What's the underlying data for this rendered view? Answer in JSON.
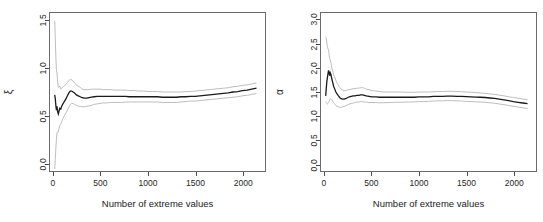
{
  "figure": {
    "background": "#ffffff",
    "line_color": "#1a1a1a",
    "band_color": "#b5b5b5",
    "axis_color": "#4d4d4d",
    "panel_count": 2
  },
  "chart_data": [
    {
      "type": "line",
      "panel": "left",
      "title": "",
      "xlabel": "Number of extreme values",
      "ylabel": "ξ",
      "ylabel_name": "xi",
      "xlim": [
        -40,
        2240
      ],
      "ylim": [
        -0.08,
        1.58
      ],
      "xticks": [
        0,
        500,
        1000,
        1500,
        2000
      ],
      "xtick_labels": [
        "0",
        "500",
        "1000",
        "1500",
        "2000"
      ],
      "yticks": [
        0.0,
        0.5,
        1.0,
        1.5
      ],
      "ytick_labels": [
        "0.0",
        "0.5",
        "1.0",
        "1.5"
      ],
      "grid": false,
      "legend": null,
      "x": [
        10,
        16,
        22,
        28,
        34,
        40,
        48,
        56,
        64,
        74,
        84,
        94,
        106,
        118,
        130,
        145,
        160,
        175,
        190,
        205,
        220,
        240,
        260,
        280,
        300,
        325,
        350,
        375,
        400,
        430,
        460,
        490,
        520,
        560,
        600,
        640,
        680,
        720,
        760,
        800,
        850,
        900,
        950,
        1000,
        1050,
        1100,
        1150,
        1200,
        1250,
        1300,
        1350,
        1400,
        1450,
        1500,
        1550,
        1600,
        1650,
        1700,
        1750,
        1800,
        1850,
        1900,
        1950,
        2000,
        2050,
        2100,
        2150
      ],
      "series": [
        {
          "name": "estimate",
          "role": "center",
          "color": "#1a1a1a",
          "values": [
            0.72,
            0.68,
            0.61,
            0.56,
            0.6,
            0.55,
            0.52,
            0.55,
            0.58,
            0.57,
            0.6,
            0.62,
            0.64,
            0.66,
            0.68,
            0.71,
            0.74,
            0.76,
            0.76,
            0.75,
            0.74,
            0.72,
            0.71,
            0.7,
            0.69,
            0.685,
            0.685,
            0.69,
            0.695,
            0.7,
            0.705,
            0.705,
            0.705,
            0.705,
            0.705,
            0.705,
            0.705,
            0.705,
            0.705,
            0.7,
            0.7,
            0.7,
            0.7,
            0.7,
            0.7,
            0.7,
            0.695,
            0.695,
            0.695,
            0.695,
            0.7,
            0.7,
            0.705,
            0.705,
            0.71,
            0.715,
            0.72,
            0.725,
            0.73,
            0.735,
            0.74,
            0.75,
            0.755,
            0.765,
            0.77,
            0.78,
            0.79
          ]
        },
        {
          "name": "upper confidence bound",
          "role": "upper",
          "color": "#b5b5b5",
          "values": [
            1.5,
            1.32,
            1.12,
            0.98,
            0.95,
            0.86,
            0.8,
            0.8,
            0.81,
            0.78,
            0.79,
            0.8,
            0.81,
            0.82,
            0.83,
            0.85,
            0.87,
            0.88,
            0.88,
            0.86,
            0.85,
            0.82,
            0.81,
            0.8,
            0.78,
            0.775,
            0.775,
            0.775,
            0.78,
            0.78,
            0.78,
            0.78,
            0.775,
            0.775,
            0.775,
            0.77,
            0.77,
            0.77,
            0.77,
            0.765,
            0.765,
            0.76,
            0.76,
            0.755,
            0.755,
            0.755,
            0.75,
            0.75,
            0.75,
            0.75,
            0.75,
            0.755,
            0.755,
            0.76,
            0.765,
            0.77,
            0.775,
            0.78,
            0.785,
            0.79,
            0.795,
            0.805,
            0.81,
            0.82,
            0.825,
            0.835,
            0.845
          ]
        },
        {
          "name": "lower confidence bound",
          "role": "lower",
          "color": "#b5b5b5",
          "values": [
            -0.06,
            0.04,
            0.16,
            0.25,
            0.32,
            0.33,
            0.33,
            0.37,
            0.4,
            0.41,
            0.44,
            0.46,
            0.49,
            0.51,
            0.53,
            0.56,
            0.59,
            0.62,
            0.63,
            0.63,
            0.62,
            0.61,
            0.6,
            0.6,
            0.595,
            0.595,
            0.6,
            0.605,
            0.61,
            0.62,
            0.625,
            0.63,
            0.635,
            0.635,
            0.64,
            0.64,
            0.64,
            0.64,
            0.645,
            0.645,
            0.645,
            0.645,
            0.645,
            0.645,
            0.645,
            0.645,
            0.64,
            0.64,
            0.64,
            0.64,
            0.645,
            0.65,
            0.655,
            0.655,
            0.66,
            0.665,
            0.67,
            0.675,
            0.68,
            0.685,
            0.69,
            0.695,
            0.7,
            0.71,
            0.715,
            0.725,
            0.735
          ]
        }
      ]
    },
    {
      "type": "line",
      "panel": "right",
      "title": "",
      "xlabel": "Number of extreme values",
      "ylabel": "α",
      "ylabel_name": "alpha",
      "xlim": [
        -40,
        2240
      ],
      "ylim": [
        -0.15,
        3.15
      ],
      "xticks": [
        0,
        500,
        1000,
        1500,
        2000
      ],
      "xtick_labels": [
        "0",
        "500",
        "1000",
        "1500",
        "2000"
      ],
      "yticks": [
        0.0,
        0.5,
        1.0,
        1.5,
        2.0,
        2.5,
        3.0
      ],
      "ytick_labels": [
        "0.0",
        "0.5",
        "1.0",
        "1.5",
        "2.0",
        "2.5",
        "3.0"
      ],
      "grid": false,
      "legend": null,
      "x": [
        10,
        16,
        22,
        28,
        34,
        40,
        46,
        52,
        58,
        66,
        74,
        84,
        94,
        106,
        118,
        130,
        145,
        160,
        175,
        190,
        205,
        220,
        240,
        260,
        280,
        300,
        320,
        340,
        360,
        380,
        400,
        420,
        440,
        470,
        500,
        540,
        580,
        620,
        660,
        700,
        750,
        800,
        850,
        900,
        950,
        1000,
        1050,
        1100,
        1150,
        1200,
        1250,
        1300,
        1350,
        1400,
        1450,
        1500,
        1550,
        1600,
        1650,
        1700,
        1750,
        1800,
        1850,
        1900,
        1950,
        2000,
        2050,
        2100,
        2150
      ],
      "series": [
        {
          "name": "estimate",
          "role": "center",
          "color": "#1a1a1a",
          "values": [
            1.42,
            1.58,
            1.72,
            1.8,
            1.88,
            1.95,
            1.9,
            1.84,
            1.9,
            1.86,
            1.78,
            1.7,
            1.62,
            1.56,
            1.5,
            1.46,
            1.42,
            1.38,
            1.36,
            1.35,
            1.35,
            1.36,
            1.38,
            1.4,
            1.41,
            1.42,
            1.42,
            1.43,
            1.43,
            1.44,
            1.44,
            1.43,
            1.42,
            1.41,
            1.4,
            1.4,
            1.39,
            1.39,
            1.39,
            1.39,
            1.39,
            1.39,
            1.39,
            1.39,
            1.39,
            1.4,
            1.4,
            1.4,
            1.41,
            1.41,
            1.41,
            1.415,
            1.415,
            1.41,
            1.41,
            1.405,
            1.4,
            1.395,
            1.39,
            1.385,
            1.375,
            1.365,
            1.35,
            1.335,
            1.32,
            1.3,
            1.285,
            1.27,
            1.255
          ]
        },
        {
          "name": "upper confidence bound",
          "role": "upper",
          "color": "#b5b5b5",
          "values": [
            2.65,
            2.62,
            2.52,
            2.45,
            2.4,
            2.38,
            2.28,
            2.2,
            2.18,
            2.1,
            2.02,
            1.94,
            1.86,
            1.8,
            1.74,
            1.69,
            1.64,
            1.59,
            1.56,
            1.54,
            1.53,
            1.53,
            1.54,
            1.55,
            1.56,
            1.57,
            1.57,
            1.58,
            1.58,
            1.59,
            1.59,
            1.58,
            1.56,
            1.55,
            1.53,
            1.52,
            1.51,
            1.5,
            1.5,
            1.5,
            1.5,
            1.5,
            1.495,
            1.495,
            1.495,
            1.5,
            1.5,
            1.5,
            1.505,
            1.51,
            1.51,
            1.515,
            1.515,
            1.51,
            1.505,
            1.5,
            1.495,
            1.49,
            1.48,
            1.47,
            1.46,
            1.45,
            1.435,
            1.42,
            1.4,
            1.385,
            1.37,
            1.355,
            1.34
          ]
        },
        {
          "name": "lower confidence bound",
          "role": "lower",
          "color": "#b5b5b5",
          "values": [
            1.3,
            1.28,
            1.26,
            1.25,
            1.26,
            1.28,
            1.3,
            1.33,
            1.36,
            1.36,
            1.34,
            1.31,
            1.28,
            1.25,
            1.22,
            1.2,
            1.19,
            1.18,
            1.18,
            1.19,
            1.2,
            1.21,
            1.23,
            1.25,
            1.26,
            1.27,
            1.28,
            1.29,
            1.29,
            1.3,
            1.3,
            1.29,
            1.29,
            1.28,
            1.28,
            1.28,
            1.275,
            1.275,
            1.28,
            1.28,
            1.285,
            1.285,
            1.29,
            1.29,
            1.295,
            1.3,
            1.3,
            1.305,
            1.31,
            1.315,
            1.315,
            1.32,
            1.32,
            1.315,
            1.31,
            1.305,
            1.3,
            1.295,
            1.29,
            1.285,
            1.275,
            1.265,
            1.25,
            1.235,
            1.22,
            1.2,
            1.185,
            1.17,
            1.155
          ]
        }
      ]
    }
  ]
}
